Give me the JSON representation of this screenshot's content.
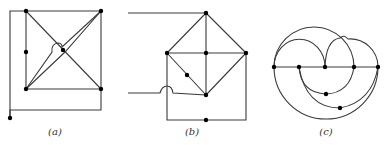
{
  "figure": {
    "panels": [
      {
        "id": "a",
        "caption": "(a)"
      },
      {
        "id": "b",
        "caption": "(b)"
      },
      {
        "id": "c",
        "caption": "(c)"
      }
    ]
  },
  "colors": {
    "edge": "#3a3a3a",
    "vertex": "#000000",
    "background": "#ffffff"
  }
}
